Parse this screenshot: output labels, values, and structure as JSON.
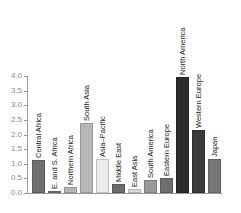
{
  "chart_data": {
    "type": "bar",
    "title": "",
    "xlabel": "",
    "ylabel": "",
    "ylim": [
      0,
      4.0
    ],
    "yticks": [
      "0.0",
      "0.5",
      "1.0",
      "1.5",
      "2.0",
      "2.5",
      "3.0",
      "3.5",
      "4.0"
    ],
    "grid": false,
    "legend": null,
    "categories": [
      "Central Africa",
      "E. and S. Africa",
      "Northern Africa",
      "South Asia",
      "Asia–Pacific",
      "Middle East",
      "East Asia",
      "South America",
      "Eastern Europe",
      "North America",
      "Western Europe",
      "Japan"
    ],
    "values": [
      1.13,
      0.07,
      0.22,
      2.4,
      1.17,
      0.3,
      0.14,
      0.45,
      0.52,
      3.98,
      2.15,
      1.16
    ],
    "colors": [
      "#6f6f6f",
      "#7a7a7a",
      "#b4b4b4",
      "#b7b7b7",
      "#ebebeb",
      "#6a6a6a",
      "#d9d9d9",
      "#9a9a9a",
      "#6e6e6e",
      "#2b2b2b",
      "#3a3a3a",
      "#777777"
    ]
  }
}
